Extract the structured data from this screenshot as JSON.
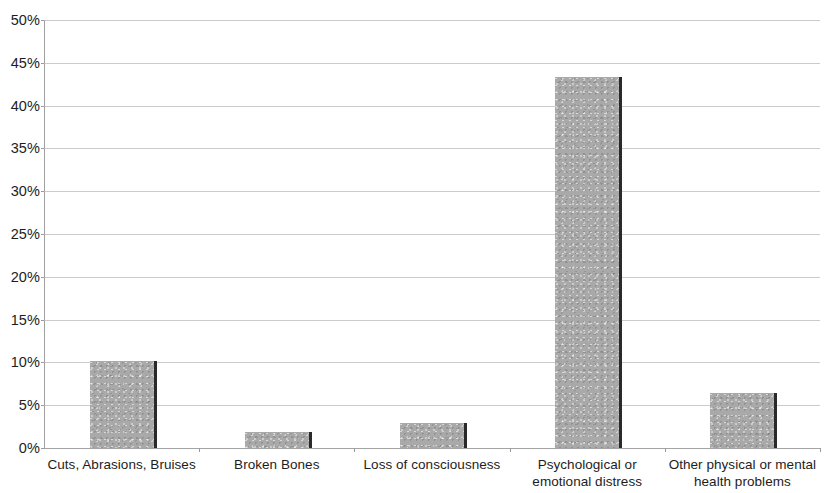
{
  "chart_data": {
    "type": "bar",
    "title": "",
    "subtitle": "",
    "xlabel": "",
    "ylabel": "",
    "categories": [
      "Cuts, Abrasions, Bruises",
      "Broken Bones",
      "Loss of consciousness",
      "Psychological or emotional distress",
      "Other physical or mental health problems"
    ],
    "category_lines": [
      [
        "Cuts, Abrasions, Bruises",
        ""
      ],
      [
        "Broken Bones",
        ""
      ],
      [
        "Loss of consciousness",
        ""
      ],
      [
        "Psychological or",
        "emotional distress"
      ],
      [
        "Other physical or mental",
        "health problems"
      ]
    ],
    "values": [
      10.2,
      1.9,
      2.9,
      43.3,
      6.4
    ],
    "value_unit": "%",
    "ylim": [
      0,
      50
    ],
    "ytick_values": [
      0,
      5,
      10,
      15,
      20,
      25,
      30,
      35,
      40,
      45,
      50
    ],
    "ytick_labels": [
      "0%",
      "5%",
      "10%",
      "15%",
      "20%",
      "25%",
      "30%",
      "35%",
      "40%",
      "45%",
      "50%"
    ],
    "grid": true,
    "legend": false,
    "legend_position": "none",
    "series": [
      {
        "name": "",
        "values": [
          10.2,
          1.9,
          2.9,
          43.3,
          6.4
        ]
      }
    ],
    "colors": {
      "bar_fill": "#a9a9a9",
      "bar_edge": "#2a2a2a",
      "gridline": "#b9b9b9",
      "axis": "#9a9a9a",
      "text": "#1d1d1d",
      "background": "#ffffff"
    }
  }
}
